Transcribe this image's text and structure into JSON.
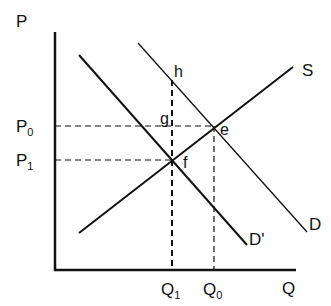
{
  "diagram": {
    "type": "supply-demand",
    "axes": {
      "y_label": "P",
      "x_label": "Q",
      "origin": [
        55,
        270
      ],
      "y_top": 45,
      "x_right": 296
    },
    "curves": [
      {
        "name": "S",
        "label": "S",
        "from": [
          79,
          233
        ],
        "to": [
          293,
          67
        ],
        "stroke": "#111111",
        "width": 2
      },
      {
        "name": "D",
        "label": "D",
        "from": [
          138,
          43
        ],
        "to": [
          307,
          232
        ],
        "stroke": "#111111",
        "width": 1.3
      },
      {
        "name": "D'",
        "label": "D'",
        "from": [
          79,
          55
        ],
        "to": [
          247,
          245
        ],
        "stroke": "#111111",
        "width": 2
      }
    ],
    "points": [
      {
        "name": "h",
        "label": "h",
        "x": 172,
        "y": 80
      },
      {
        "name": "g",
        "label": "g",
        "x": 172,
        "y": 126
      },
      {
        "name": "e",
        "label": "e",
        "x": 214,
        "y": 126
      },
      {
        "name": "f",
        "label": "f",
        "x": 172,
        "y": 160
      }
    ],
    "price_labels": {
      "p0": {
        "main": "P",
        "sub": "0",
        "y": 126
      },
      "p1": {
        "main": "P",
        "sub": "1",
        "y": 160
      }
    },
    "quantity_labels": {
      "q1": {
        "main": "Q",
        "sub": "1",
        "x": 172
      },
      "q0": {
        "main": "Q",
        "sub": "0",
        "x": 214
      }
    },
    "colors": {
      "line": "#111111",
      "background": "#ffffff"
    }
  }
}
